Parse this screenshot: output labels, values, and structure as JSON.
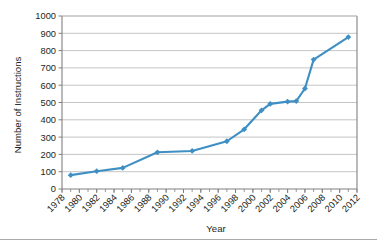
{
  "chart_data": {
    "type": "line",
    "title": "",
    "xlabel": "Year",
    "ylabel": "Number of Instructions",
    "xlim": [
      1978,
      2012
    ],
    "ylim": [
      0,
      1000
    ],
    "ytick_step": 100,
    "xtick_step": 2,
    "minor_xtick_step": 1,
    "grid": "horizontal",
    "legend": "none",
    "series_color": "#3E8FC4",
    "marker": "diamond",
    "yticks": [
      0,
      100,
      200,
      300,
      400,
      500,
      600,
      700,
      800,
      900,
      1000
    ],
    "xticks": [
      1978,
      1980,
      1982,
      1984,
      1986,
      1988,
      1990,
      1992,
      1994,
      1996,
      1998,
      2000,
      2002,
      2004,
      2006,
      2008,
      2010,
      2012
    ],
    "x": [
      1979,
      1982,
      1985,
      1989,
      1993,
      1997,
      1999,
      2001,
      2002,
      2004,
      2005,
      2006,
      2007,
      2011
    ],
    "values": [
      80,
      103,
      122,
      212,
      220,
      276,
      345,
      455,
      492,
      505,
      508,
      581,
      748,
      878
    ],
    "series": [
      {
        "name": "Number of Instructions",
        "points": [
          {
            "x": 1979,
            "y": 80
          },
          {
            "x": 1982,
            "y": 103
          },
          {
            "x": 1985,
            "y": 122
          },
          {
            "x": 1989,
            "y": 212
          },
          {
            "x": 1993,
            "y": 220
          },
          {
            "x": 1997,
            "y": 276
          },
          {
            "x": 1999,
            "y": 345
          },
          {
            "x": 2001,
            "y": 455
          },
          {
            "x": 2002,
            "y": 492
          },
          {
            "x": 2004,
            "y": 505
          },
          {
            "x": 2005,
            "y": 508
          },
          {
            "x": 2006,
            "y": 581
          },
          {
            "x": 2007,
            "y": 748
          },
          {
            "x": 2011,
            "y": 878
          }
        ]
      }
    ]
  },
  "axes": {
    "y_title": "Number of Instructions",
    "x_title": "Year",
    "y_tick_labels": [
      "1000",
      "900",
      "800",
      "700",
      "600",
      "500",
      "400",
      "300",
      "200",
      "100",
      "0"
    ],
    "x_tick_labels": [
      "1978",
      "1980",
      "1982",
      "1984",
      "1986",
      "1988",
      "1990",
      "1992",
      "1994",
      "1996",
      "1998",
      "2000",
      "2002",
      "2004",
      "2006",
      "2008",
      "2010",
      "2012"
    ]
  },
  "colors": {
    "series": "#3E8FC4",
    "grid": "#b6b6b6",
    "frame": "#808080",
    "text": "#231f20",
    "background": "#ffffff"
  }
}
